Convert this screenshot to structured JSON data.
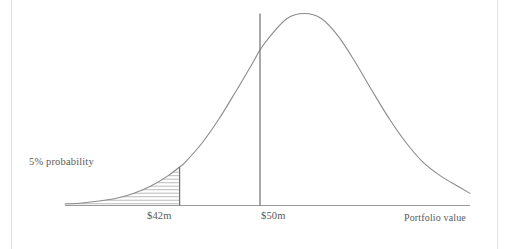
{
  "figure": {
    "background_color": "#ffffff",
    "curve_color": "#8b8b8b",
    "rule_color": "#6f6f6f",
    "hatch_color": "#a9a9a9",
    "text_color": "#5a5a58",
    "border_color": "#e2e2e2"
  },
  "labels": {
    "probability_annotation": "5% probability",
    "tick_42": "$42m",
    "tick_50": "$50m",
    "x_axis_title": "Portfolio value"
  },
  "chart_data": {
    "type": "area",
    "title": "",
    "subtitle": "",
    "xlabel": "Portfolio value",
    "ylabel": "",
    "grid": false,
    "legend": false,
    "distribution": "normal",
    "mean": 50,
    "mean_label": "$50m",
    "threshold": 42,
    "threshold_label": "$42m",
    "tail_probability_percent": 5,
    "tail_probability_label": "5% probability",
    "tail_side": "left",
    "annotations": [
      {
        "text": "5% probability",
        "target": "left-tail shaded region"
      },
      {
        "text": "$42m",
        "target": "threshold vertical line"
      },
      {
        "text": "$50m",
        "target": "mean vertical line"
      },
      {
        "text": "Portfolio value",
        "target": "x-axis"
      }
    ],
    "tick_labels": [
      "$42m",
      "$50m"
    ],
    "tick_values": [
      42,
      50
    ],
    "xlim": [
      30.6,
      70.9
    ],
    "ylim": [
      0,
      1
    ],
    "shaded_region": {
      "from": 30.6,
      "to": 42,
      "fill": "horizontal-hatch"
    },
    "x": [
      30.6,
      32.3,
      34.0,
      35.7,
      37.4,
      39.1,
      40.8,
      42.0,
      42.5,
      44.2,
      45.9,
      47.6,
      49.3,
      50.0,
      51.0,
      52.7,
      54.4,
      56.1,
      57.8,
      59.5,
      61.2,
      62.9,
      64.6,
      66.3,
      68.0,
      69.7,
      70.9
    ],
    "y": [
      0.008,
      0.013,
      0.023,
      0.038,
      0.063,
      0.1,
      0.153,
      0.201,
      0.222,
      0.323,
      0.449,
      0.594,
      0.745,
      0.81,
      0.881,
      0.974,
      1.0,
      0.974,
      0.881,
      0.745,
      0.594,
      0.449,
      0.323,
      0.222,
      0.153,
      0.1,
      0.063
    ],
    "hatch_line_count": 11
  }
}
